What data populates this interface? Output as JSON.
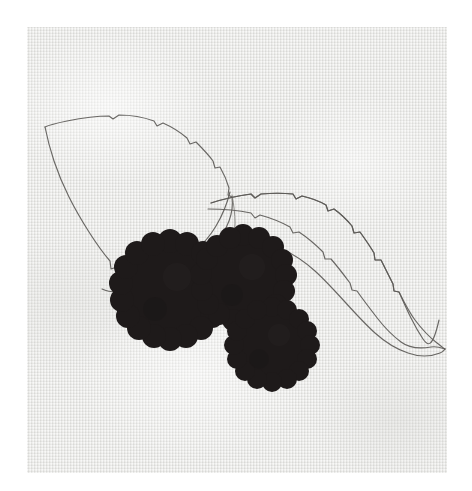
{
  "artwork": {
    "title": "Blackberry Sprig Study",
    "medium": "Embroidery and pencil on linen",
    "caption": "",
    "canvas": {
      "width_px": 472,
      "height_px": 491,
      "border_color": "#ffffff"
    },
    "fabric": {
      "name": "linen-panel",
      "left_px": 27,
      "top_px": 27,
      "width_px": 420,
      "height_px": 446,
      "base_color": "#e9e9e7",
      "weave_light": "#ffffff",
      "weave_dark": "#cbcbc8",
      "description": "Plain-weave natural linen ground, slightly mottled"
    },
    "palette": {
      "berry_dark": "#1e1a1a",
      "berry_mid": "#211d1d",
      "pencil_line": "#5d5b58",
      "pencil_line_faint": "#76746f",
      "paper_white": "#ffffff"
    },
    "elements": [
      {
        "id": "leaf-left",
        "label": "Large serrated leaf, upper left",
        "kind": "pencil-outline",
        "tip_point": "45,127",
        "notes": "Teardrop blade with toothed margin, point toward the left edge"
      },
      {
        "id": "leaf-right",
        "label": "Narrow elongated leaf, upper right",
        "kind": "pencil-outline",
        "tip_point": "445,320",
        "notes": "Lance-shaped blade with central vein and toothed upper margin"
      },
      {
        "id": "tendril",
        "label": "Curling tendril",
        "kind": "pencil-outline",
        "notes": "Wavy S-curve line trailing from the stem toward lower right"
      },
      {
        "id": "stem",
        "label": "Connecting stem",
        "kind": "pencil-outline",
        "notes": "Thin arcing line joining the two leaves over the berry cluster"
      },
      {
        "id": "berry-left",
        "label": "Left blackberry",
        "kind": "stitched-fill",
        "center": "170,290",
        "radius_px": 54,
        "lobes": 17,
        "color": "#1e1a1a"
      },
      {
        "id": "berry-top",
        "label": "Top blackberry",
        "kind": "stitched-fill",
        "center": "243,278",
        "radius_px": 48,
        "lobes": 16,
        "color": "#1e1a1a"
      },
      {
        "id": "berry-bottom",
        "label": "Lower blackberry",
        "kind": "stitched-fill",
        "center": "272,345",
        "radius_px": 43,
        "lobes": 15,
        "color": "#1e1a1a"
      }
    ],
    "berry_count": 3,
    "leaf_count": 2
  }
}
